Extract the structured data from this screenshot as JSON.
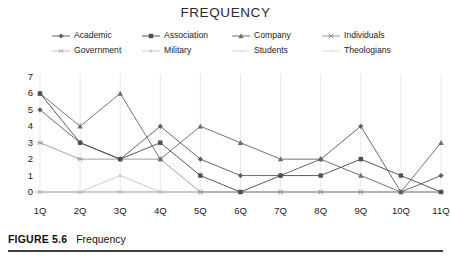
{
  "chart_data": {
    "type": "line",
    "title": "FREQUENCY",
    "xlabel": "",
    "ylabel": "",
    "categories": [
      "1Q",
      "2Q",
      "3Q",
      "4Q",
      "5Q",
      "6Q",
      "7Q",
      "8Q",
      "9Q",
      "10Q",
      "11Q"
    ],
    "ylim": [
      0,
      7
    ],
    "yticks": [
      0,
      1,
      2,
      3,
      4,
      5,
      6,
      7
    ],
    "grid": "vertical",
    "legend_position": "top",
    "series": [
      {
        "name": "Academic",
        "marker": "diamond",
        "color": "#5f5f5f",
        "values": [
          5,
          3,
          2,
          4,
          2,
          1,
          1,
          2,
          4,
          0,
          1
        ]
      },
      {
        "name": "Association",
        "marker": "square",
        "color": "#4f4f4f",
        "values": [
          6,
          3,
          2,
          3,
          1,
          0,
          1,
          1,
          2,
          1,
          0
        ]
      },
      {
        "name": "Company",
        "marker": "triangle",
        "color": "#6d6d6d",
        "values": [
          6,
          4,
          6,
          2,
          4,
          3,
          2,
          2,
          1,
          0,
          3
        ]
      },
      {
        "name": "Individuals",
        "marker": "cross",
        "color": "#9a9a9a",
        "values": [
          3,
          2,
          2,
          2,
          0,
          0,
          0,
          0,
          0,
          0,
          0
        ]
      },
      {
        "name": "Government",
        "marker": "cross",
        "color": "#bdbdbd",
        "values": [
          0,
          0,
          0,
          0,
          0,
          0,
          0,
          0,
          0,
          0,
          0
        ]
      },
      {
        "name": "Military",
        "marker": "dot",
        "color": "#c9c9c9",
        "values": [
          0,
          0,
          1,
          0,
          0,
          0,
          0,
          0,
          0,
          0,
          0
        ]
      },
      {
        "name": "Students",
        "marker": "line",
        "color": "#d5d5d5",
        "values": [
          0,
          0,
          0,
          0,
          0,
          0,
          0,
          0,
          0,
          0,
          0
        ]
      },
      {
        "name": "Theologians",
        "marker": "dotline",
        "color": "#dcdcdc",
        "values": [
          0,
          0,
          0,
          0,
          0,
          0,
          0,
          0,
          0,
          0,
          0
        ]
      }
    ]
  },
  "caption": {
    "figure_id": "FIGURE 5.6",
    "figure_text": "Frequency"
  }
}
